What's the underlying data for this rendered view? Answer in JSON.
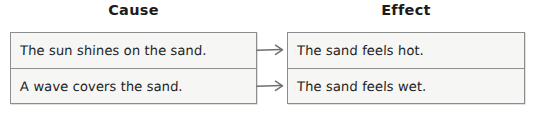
{
  "diagram": {
    "type": "cause-and-effect-chart",
    "columns": [
      {
        "id": "cause",
        "heading": "Cause"
      },
      {
        "id": "effect",
        "heading": "Effect"
      }
    ],
    "pairs": [
      {
        "cause": "The sun shines on the sand.",
        "effect": "The sand feels hot.",
        "connector": "arrow-right"
      },
      {
        "cause": "A wave covers the sand.",
        "effect": "The sand feels wet.",
        "connector": "arrow-right"
      }
    ],
    "colors": {
      "page_background": "#ffffff",
      "box_fill": "#f6f6f5",
      "box_border": "#8d8d8d",
      "row_divider": "#8f8f8f",
      "text": "#1f1f1f",
      "heading_text": "#1b1b1b",
      "arrow": "#6f6f6f"
    }
  }
}
